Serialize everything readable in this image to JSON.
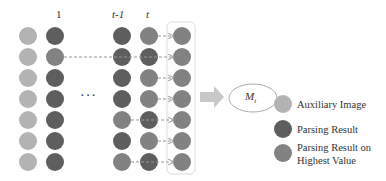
{
  "colors": {
    "auxiliary": "#b3b3b3",
    "parsing": "#5e5e5e",
    "highest": "#828282",
    "arrow": "#999999",
    "box": "#dddddd"
  },
  "columns": {
    "labels": [
      "1",
      "t-1",
      "t"
    ],
    "ellipsis": "···"
  },
  "model_label": "M",
  "model_subscript": "t",
  "legend": [
    {
      "label": "Auxiliary Image",
      "color_key": "auxiliary"
    },
    {
      "label": "Parsing Result",
      "color_key": "parsing"
    },
    {
      "label": "Parsing Result on",
      "label2": "Highest Value",
      "color_key": "highest"
    }
  ],
  "grid": {
    "rows": 7,
    "col_aux": [
      "aux",
      "aux",
      "aux",
      "aux",
      "aux",
      "aux",
      "aux"
    ],
    "col_1": [
      "parsing",
      "highest",
      "parsing",
      "parsing",
      "parsing",
      "parsing",
      "parsing"
    ],
    "col_tm1": [
      "parsing",
      "parsing",
      "parsing",
      "parsing",
      "highest",
      "parsing",
      "highest"
    ],
    "col_t": [
      "highest",
      "parsing",
      "highest",
      "highest",
      "parsing",
      "highest",
      "parsing"
    ],
    "col_result": [
      "highest",
      "highest",
      "highest",
      "highest",
      "highest",
      "highest",
      "highest"
    ]
  }
}
